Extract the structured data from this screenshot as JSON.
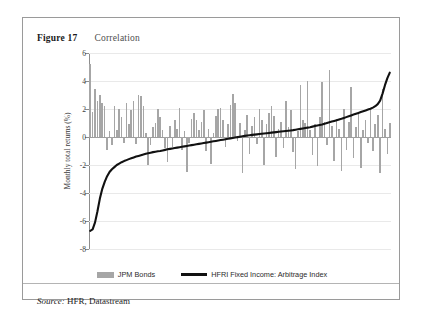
{
  "figure": {
    "label": "Figure 17",
    "title": "Correlation",
    "source_label": "Source:",
    "source_text": " HFR, Datastream"
  },
  "legend": {
    "bars_label": "JPM Bonds",
    "line_label": "HFRI Fixed Income: Arbitrage Index"
  },
  "colors": {
    "bar": "#a6a6a6",
    "line": "#111111",
    "grid": "#e9e9e9",
    "axis": "#8d8d8d",
    "border": "#9a9a9a"
  },
  "chart_data": {
    "type": "bar",
    "title": "Correlation",
    "xlabel": "",
    "ylabel": "Monthly total returns (%)",
    "ylim": [
      -8,
      6
    ],
    "yticks": [
      6,
      4,
      2,
      0,
      -2,
      -4,
      -6,
      -8
    ],
    "ytick_labels": [
      "6",
      "4",
      "2",
      "0",
      "-2",
      "-4",
      "-6",
      "-8"
    ],
    "grid": true,
    "xaxis_visible": false,
    "legend_position": "bottom-center",
    "series": [
      {
        "name": "JPM Bonds",
        "type": "bar",
        "color": "#a6a6a6",
        "values": [
          5.2,
          1.8,
          3.4,
          2.6,
          3.0,
          2.4,
          2.2,
          -0.9,
          0.4,
          -0.6,
          2.2,
          0.5,
          2.0,
          1.4,
          -0.4,
          2.4,
          0.9,
          1.9,
          2.6,
          -0.5,
          3.0,
          2.9,
          2.2,
          0.3,
          -2.0,
          -0.6,
          0.7,
          1.0,
          2.0,
          1.4,
          0.5,
          -0.8,
          -1.8,
          0.8,
          -0.7,
          1.2,
          0.6,
          2.1,
          -0.9,
          0.4,
          -2.5,
          -0.4,
          1.3,
          1.7,
          1.2,
          0.5,
          1.1,
          1.9,
          -1.0,
          0.6,
          -1.9,
          0.3,
          1.5,
          2.0,
          2.1,
          1.2,
          -0.7,
          0.9,
          2.3,
          3.1,
          2.4,
          -0.3,
          1.0,
          -2.6,
          0.5,
          1.6,
          -1.2,
          0.8,
          1.4,
          -0.5,
          2.0,
          1.2,
          -2.0,
          0.9,
          1.7,
          2.2,
          1.5,
          -1.4,
          0.6,
          1.1,
          -0.8,
          2.6,
          0.7,
          1.9,
          -1.1,
          -2.3,
          0.4,
          3.7,
          1.2,
          1.0,
          4.0,
          0.5,
          -1.3,
          0.9,
          -2.1,
          1.4,
          3.9,
          1.1,
          -0.6,
          4.8,
          0.8,
          -1.7,
          1.3,
          0.6,
          -2.4,
          2.0,
          -0.9,
          1.1,
          3.6,
          -1.5,
          0.7,
          1.8,
          -2.2,
          0.5,
          1.2,
          -0.4,
          2.1,
          -1.0,
          0.9,
          1.6,
          -2.6,
          3.4,
          0.6,
          -1.2,
          1.0
        ]
      },
      {
        "name": "HFRI Fixed Income: Arbitrage Index",
        "type": "line",
        "color": "#111111",
        "values": [
          -6.7,
          -6.6,
          -6.1,
          -5.3,
          -4.4,
          -3.7,
          -3.2,
          -2.8,
          -2.5,
          -2.3,
          -2.15,
          -2.0,
          -1.9,
          -1.8,
          -1.72,
          -1.65,
          -1.58,
          -1.52,
          -1.46,
          -1.4,
          -1.35,
          -1.3,
          -1.25,
          -1.2,
          -1.16,
          -1.12,
          -1.08,
          -1.05,
          -1.02,
          -1.0,
          -0.96,
          -0.92,
          -0.88,
          -0.85,
          -0.82,
          -0.79,
          -0.76,
          -0.73,
          -0.7,
          -0.67,
          -0.64,
          -0.61,
          -0.58,
          -0.55,
          -0.52,
          -0.49,
          -0.46,
          -0.43,
          -0.4,
          -0.37,
          -0.34,
          -0.31,
          -0.28,
          -0.25,
          -0.22,
          -0.19,
          -0.16,
          -0.13,
          -0.1,
          -0.07,
          -0.04,
          -0.01,
          0.02,
          0.05,
          0.08,
          0.11,
          0.13,
          0.15,
          0.17,
          0.19,
          0.21,
          0.23,
          0.25,
          0.27,
          0.29,
          0.31,
          0.33,
          0.35,
          0.37,
          0.39,
          0.41,
          0.43,
          0.45,
          0.47,
          0.49,
          0.52,
          0.55,
          0.58,
          0.61,
          0.64,
          0.67,
          0.7,
          0.74,
          0.78,
          0.82,
          0.86,
          0.9,
          0.95,
          1.0,
          1.05,
          1.1,
          1.15,
          1.2,
          1.25,
          1.3,
          1.36,
          1.42,
          1.48,
          1.54,
          1.6,
          1.66,
          1.72,
          1.78,
          1.84,
          1.9,
          1.96,
          2.02,
          2.1,
          2.2,
          2.35,
          2.6,
          3.1,
          3.7,
          4.2,
          4.6
        ]
      }
    ]
  }
}
